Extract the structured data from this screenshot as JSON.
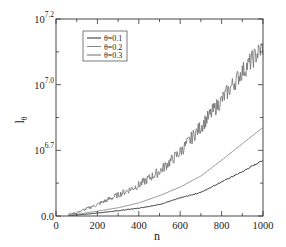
{
  "chart_data": {
    "type": "line",
    "title": "",
    "xlabel": "n",
    "ylabel": "l",
    "ylabel_subscript": "θ",
    "xlim": [
      0,
      1000
    ],
    "ylim": [
      0,
      600
    ],
    "x_ticks": [
      0,
      200,
      400,
      600,
      800,
      1000
    ],
    "x_tick_labels": [
      "0",
      "200",
      "400",
      "600",
      "800",
      "1000"
    ],
    "x_minor_ticks": [
      100,
      300,
      500,
      700,
      900
    ],
    "y_ticks": [
      0,
      200,
      400,
      600
    ],
    "y_tick_labels": [
      {
        "base": "0.0",
        "exp": ""
      },
      {
        "base": "10",
        "exp": "6.7"
      },
      {
        "base": "10",
        "exp": "7.0"
      },
      {
        "base": "10",
        "exp": "7.2"
      }
    ],
    "y_minor_ticks": [
      100,
      300,
      500
    ],
    "grid": false,
    "legend_position": "upper-left",
    "x": [
      0,
      100,
      200,
      300,
      400,
      500,
      600,
      700,
      800,
      900,
      1000
    ],
    "series": [
      {
        "name": "θ=0.1",
        "color": "#2a2a2a",
        "noise": 2,
        "values": [
          0,
          3,
          9,
          16,
          24,
          35,
          55,
          72,
          104,
          135,
          170
        ]
      },
      {
        "name": "θ=0.2",
        "color": "#8a8a8a",
        "noise": 0.6,
        "values": [
          0,
          5,
          15,
          25,
          40,
          62,
          88,
          122,
          170,
          220,
          270
        ]
      },
      {
        "name": "θ=0.3",
        "color": "#6e6e6e",
        "noise": 14,
        "values": [
          0,
          10,
          35,
          64,
          94,
          136,
          195,
          272,
          353,
          440,
          515
        ]
      }
    ]
  }
}
